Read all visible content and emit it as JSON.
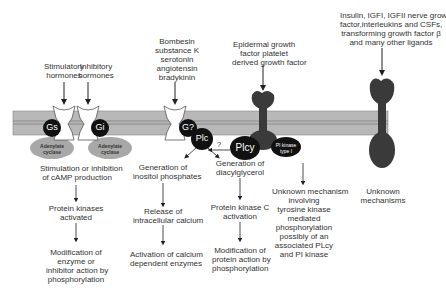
{
  "ligands": {
    "stimulatory": [
      "Stimulatory",
      "hormones"
    ],
    "inhibitory": [
      "Inhibitory",
      "hormones"
    ],
    "bombesin": [
      "Bombesin",
      "substance K",
      "serotonin",
      "angiotensin",
      "bradykinin"
    ],
    "egf": [
      "Epidermal growth",
      "factor platelet",
      "derived growth factor"
    ],
    "insulin": [
      "Insulin, IGFI, IGFII nerve growth",
      "factor,interleukins and CSFs,",
      "transforming growth factor β",
      "and many other ligands"
    ]
  },
  "proteins": {
    "gs": "Gs",
    "gi": "Gi",
    "gq": "G?",
    "plc": "Plc",
    "plcy": "Plcy",
    "pi_kinase": [
      "PI kinase",
      "type I"
    ],
    "adenylate_left": [
      "Adenylate",
      "cyclase"
    ],
    "adenylate_right": [
      "Adenylate",
      "cyclase"
    ]
  },
  "question_mark": "?",
  "pathways": {
    "camp": [
      [
        "Stimulation or inhibition",
        "of cAMP production"
      ],
      [
        "Protein kinases",
        "activated"
      ],
      [
        "Modification of",
        "enzyme or",
        "inhibitor action by",
        "phosphorylation"
      ]
    ],
    "inositol": [
      [
        "Generation of",
        "inositol phosphates"
      ],
      [
        "Release of",
        "intracellular calcium"
      ],
      [
        "Activation of calcium",
        "dependent enzymes"
      ]
    ],
    "dag": [
      [
        "Generation of",
        "diacylglycerol"
      ],
      [
        "Protein kinase C",
        "activation"
      ],
      [
        "Modification of",
        "protein action by",
        "phosphorylation"
      ]
    ],
    "tyrosine": [
      [
        "Unknown mechanism",
        "involving",
        "tyrosine kinase",
        "mediated",
        "phosphorylation",
        "possibly of an",
        "associated PLcy",
        "and PI kinase"
      ]
    ],
    "unknown": [
      [
        "Unknown",
        "mechanisms"
      ]
    ]
  }
}
